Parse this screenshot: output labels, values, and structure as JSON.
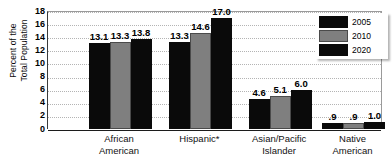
{
  "chart_data": {
    "type": "bar",
    "title": "",
    "xlabel": "",
    "ylabel": "Percent of the\nTotal Population",
    "ylim": [
      0,
      18
    ],
    "ytick_step": 2,
    "yticks": [
      18,
      16,
      14,
      12,
      10,
      8,
      6,
      4,
      2,
      0
    ],
    "grid": true,
    "legend_position": "top-right",
    "categories": [
      "African\nAmerican",
      "Hispanic*",
      "Asian/Pacific\nIslander",
      "Native\nAmerican"
    ],
    "series": [
      {
        "name": "2005",
        "color": "#0a0a0a",
        "values": [
          13.1,
          13.3,
          4.6,
          0.9
        ],
        "labels": [
          "13.1",
          "13.3",
          "4.6",
          ".9"
        ]
      },
      {
        "name": "2010",
        "color": "#7f7f7f",
        "values": [
          13.3,
          14.6,
          5.1,
          0.9
        ],
        "labels": [
          "13.3",
          "14.6",
          "5.1",
          ".9"
        ]
      },
      {
        "name": "2020",
        "color": "#0a0a0a",
        "values": [
          13.8,
          17.0,
          6.0,
          1.0
        ],
        "labels": [
          "13.8",
          "17.0",
          "6.0",
          "1.0"
        ]
      }
    ]
  },
  "legend": {
    "items": [
      {
        "label": "2005",
        "swatch": "dark"
      },
      {
        "label": "2010",
        "swatch": "gray"
      },
      {
        "label": "2020",
        "swatch": "dark"
      }
    ]
  }
}
